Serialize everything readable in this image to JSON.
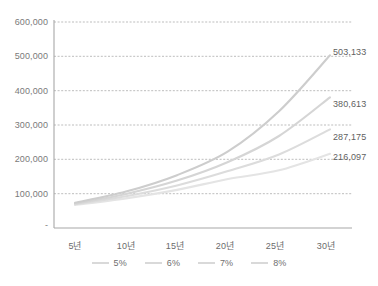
{
  "chart_data": {
    "type": "line",
    "title": "",
    "xlabel": "",
    "ylabel": "",
    "categories": [
      "5년",
      "10년",
      "15년",
      "20년",
      "25년",
      "30년"
    ],
    "x": [
      5,
      10,
      15,
      20,
      25,
      30
    ],
    "ylim": [
      0,
      600000
    ],
    "yticks": [
      0,
      100000,
      200000,
      300000,
      400000,
      500000,
      600000
    ],
    "ytick_labels": [
      "-",
      "100,000",
      "200,000",
      "300,000",
      "400,000",
      "500,000",
      "600,000"
    ],
    "grid": true,
    "legend_position": "bottom",
    "series": [
      {
        "name": "5%",
        "color": "#e4e4e4",
        "values": [
          67100,
          86300,
          111000,
          142800,
          168000,
          216097
        ],
        "end_label": "216,097"
      },
      {
        "name": "6%",
        "color": "#dcdcdc",
        "values": [
          69100,
          92500,
          123800,
          165700,
          214000,
          287175
        ],
        "end_label": "287,175"
      },
      {
        "name": "7%",
        "color": "#d5d5d5",
        "values": [
          71200,
          99100,
          138000,
          192200,
          268000,
          380613
        ],
        "end_label": "380,613"
      },
      {
        "name": "8%",
        "color": "#cdcdcd",
        "values": [
          73300,
          106200,
          153900,
          223000,
          340000,
          503133
        ],
        "end_label": "503,133"
      }
    ],
    "data_labels": [
      "503,133",
      "380,613",
      "287,175",
      "216,097"
    ]
  },
  "legend": {
    "items": [
      {
        "label": "5%"
      },
      {
        "label": "6%"
      },
      {
        "label": "7%"
      },
      {
        "label": "8%"
      }
    ]
  },
  "caption": {
    "text": ""
  }
}
